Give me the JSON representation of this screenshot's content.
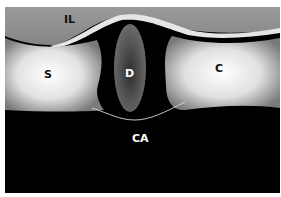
{
  "diagram": {
    "labels": {
      "il": "IL",
      "s": "S",
      "d": "D",
      "c": "C",
      "ca": "CA"
    },
    "colors": {
      "background_top": "#8f8f8f",
      "background_bottom": "#000000",
      "block_light": "#f4f4f4",
      "block_dark": "#6e6e6e",
      "disc_center": "#333333",
      "disc_edge": "#6a6a6a",
      "ligament": "#e0e0e0",
      "label_dark": "#111111",
      "label_light": "#ffffff"
    }
  }
}
